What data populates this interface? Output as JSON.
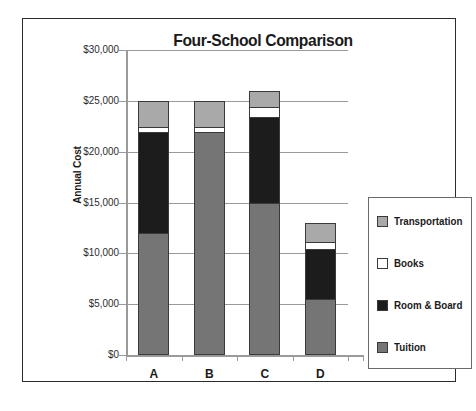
{
  "chart_data": {
    "type": "bar",
    "subtype": "stacked-vertical",
    "title": "Four-School Comparison",
    "xlabel": "",
    "ylabel": "Annual Cost",
    "categories": [
      "A",
      "B",
      "C",
      "D"
    ],
    "ylim": [
      0,
      30000
    ],
    "ytick_values": [
      0,
      5000,
      10000,
      15000,
      20000,
      25000,
      30000
    ],
    "ytick_labels": [
      "$0",
      "$5,000",
      "$10,000",
      "$15,000",
      "$20,000",
      "$25,000",
      "$30,000"
    ],
    "grid": true,
    "legend_position": "right",
    "series": [
      {
        "name": "Tuition",
        "color": "#757575",
        "values": [
          12000,
          22000,
          15000,
          5500
        ]
      },
      {
        "name": "Room & Board",
        "color": "#1c1c1c",
        "values": [
          10000,
          0,
          8500,
          5000
        ]
      },
      {
        "name": "Books",
        "color": "#ffffff",
        "values": [
          500,
          500,
          1000,
          700
        ]
      },
      {
        "name": "Transportation",
        "color": "#a9a9a9",
        "values": [
          2500,
          2500,
          1500,
          1800
        ]
      }
    ],
    "totals": [
      25000,
      25000,
      26000,
      13000
    ],
    "stack_order_bottom_to_top": [
      "Tuition",
      "Room & Board",
      "Books",
      "Transportation"
    ]
  },
  "legend": {
    "entries": [
      {
        "label": "Transportation",
        "color": "#a9a9a9",
        "swatch_icon": "legend-swatch-transportation"
      },
      {
        "label": "Books",
        "color": "#ffffff",
        "swatch_icon": "legend-swatch-books"
      },
      {
        "label": "Room & Board",
        "color": "#1c1c1c",
        "swatch_icon": "legend-swatch-room-and-board"
      },
      {
        "label": "Tuition",
        "color": "#757575",
        "swatch_icon": "legend-swatch-tuition"
      }
    ]
  },
  "colors": {
    "frame_border": "#2b2b2b",
    "axis": "#9a9a9a",
    "gridline": "#9a9a9a",
    "text": "#1a1a1a",
    "background": "#ffffff"
  }
}
